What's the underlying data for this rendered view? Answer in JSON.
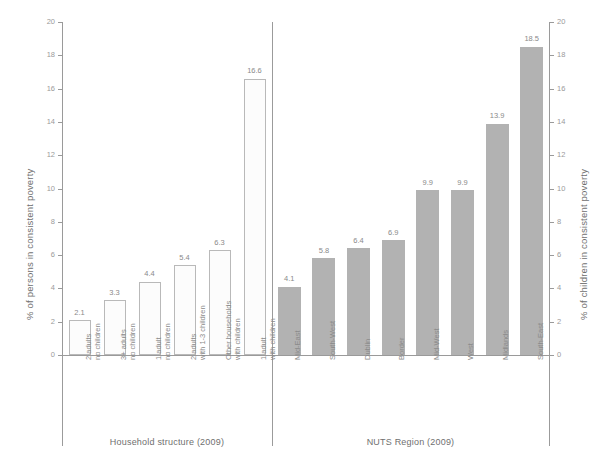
{
  "chart_data": {
    "type": "bar",
    "title": "",
    "subtitle": "",
    "grid": false,
    "legend": "none",
    "ylim": [
      0,
      20
    ],
    "yticks": [
      0,
      2,
      4,
      6,
      8,
      10,
      12,
      14,
      16,
      18,
      20
    ],
    "ytick_labels": [
      "0",
      "2",
      "4",
      "6",
      "8",
      "10",
      "12",
      "14",
      "16",
      "18",
      "20"
    ],
    "ylabel": "% of persons in consistent poverty",
    "ylabel_right": "% of children in consistent poverty",
    "xlabel": "",
    "panels": [
      {
        "id": "household",
        "caption": "Household structure (2009)",
        "bar_style": "outlined",
        "categories": [
          "2 adults\nno children",
          "3+ adults\nno children",
          "1 adult\nno children",
          "2 adults\nwith 1-3 children",
          "Other households\nwith children",
          "1 adult\nwith children"
        ],
        "values": [
          2.1,
          3.3,
          4.4,
          5.4,
          6.3,
          16.6
        ],
        "value_labels": [
          "2.1",
          "3.3",
          "4.4",
          "5.4",
          "6.3",
          "16.6"
        ]
      },
      {
        "id": "nuts",
        "caption": "NUTS Region (2009)",
        "bar_style": "filled",
        "categories": [
          "Mid-East",
          "South-West",
          "Dublin",
          "Border",
          "Mid-West",
          "West",
          "Midlands",
          "South-East"
        ],
        "values": [
          4.1,
          5.8,
          6.4,
          6.9,
          9.9,
          9.9,
          13.9,
          18.5
        ],
        "value_labels": [
          "4.1",
          "5.8",
          "6.4",
          "6.9",
          "9.9",
          "9.9",
          "13.9",
          "18.5"
        ]
      }
    ]
  },
  "colors": {
    "bar_filled": "#b2b2b2",
    "bar_outline": "#b9b9b9",
    "bar_outlined_fill": "#fcfcfc",
    "axis": "#9a9a9a",
    "text": "#8a8a8a",
    "text_strong": "#6f6f6f",
    "background": "#ffffff"
  }
}
